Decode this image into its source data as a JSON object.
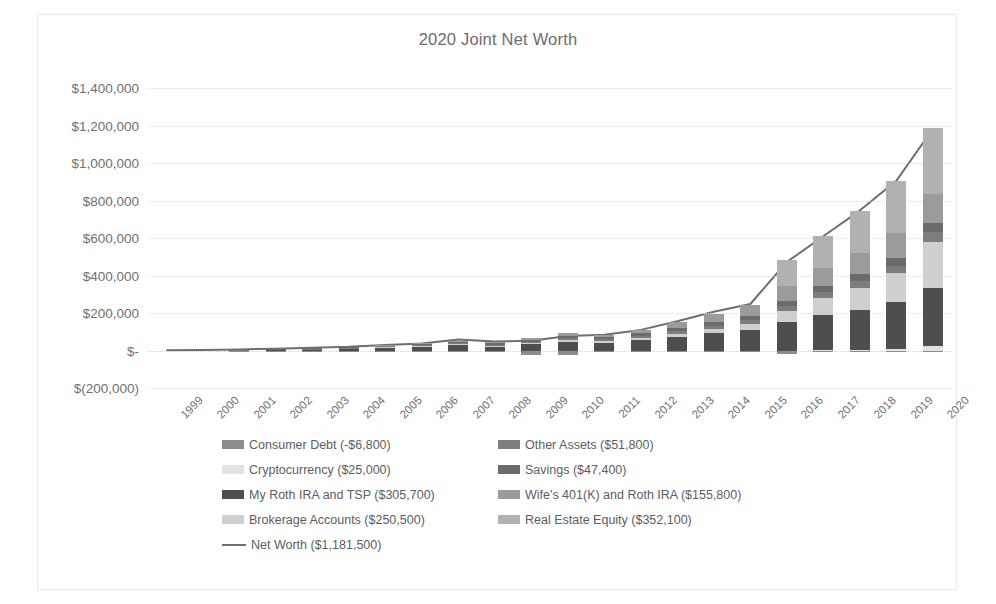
{
  "chart_data": {
    "type": "bar",
    "stacked": true,
    "title": "2020 Joint Net Worth",
    "xlabel": "",
    "ylabel": "",
    "ylim": [
      -200000,
      1400000
    ],
    "ytick_step": 200000,
    "ytick_labels": [
      "$1,400,000",
      "$1,200,000",
      "$1,000,000",
      "$800,000",
      "$600,000",
      "$400,000",
      "$200,000",
      "$-",
      "$(200,000)"
    ],
    "ytick_values": [
      1400000,
      1200000,
      1000000,
      800000,
      600000,
      400000,
      200000,
      0,
      -200000
    ],
    "grid": true,
    "legend_position": "bottom",
    "categories": [
      "1999",
      "2000",
      "2001",
      "2002",
      "2003",
      "2004",
      "2005",
      "2006",
      "2007",
      "2008",
      "2009",
      "2010",
      "2011",
      "2012",
      "2013",
      "2014",
      "2015",
      "2016",
      "2017",
      "2018",
      "2019",
      "2020"
    ],
    "series": [
      {
        "name": "Consumer Debt (-$6,800)",
        "label": "Consumer Debt",
        "current_value": -6800,
        "color": "#8b8c8e",
        "values": [
          0,
          0,
          -2000,
          -2500,
          -2500,
          -3000,
          -5000,
          -6000,
          -4000,
          -3000,
          -22000,
          -24000,
          -9000,
          -7000,
          -5000,
          -4000,
          -3000,
          -18000,
          -10000,
          -8000,
          -7000,
          -6800
        ]
      },
      {
        "name": "Cryptocurrency ($25,000)",
        "label": "Cryptocurrency",
        "current_value": 25000,
        "color": "#e2e2e2",
        "values": [
          0,
          0,
          0,
          0,
          0,
          0,
          0,
          0,
          0,
          0,
          0,
          0,
          0,
          0,
          0,
          0,
          0,
          0,
          4000,
          3000,
          6000,
          25000
        ]
      },
      {
        "name": "My Roth IRA and TSP ($305,700)",
        "label": "My Roth IRA and TSP",
        "current_value": 305700,
        "color": "#4d4e50",
        "values": [
          0,
          0,
          3000,
          5000,
          7000,
          10000,
          16000,
          22000,
          30000,
          22000,
          34000,
          48000,
          42000,
          56000,
          74000,
          92000,
          110000,
          150000,
          185000,
          215000,
          255000,
          305700
        ]
      },
      {
        "name": "Brokerage Accounts ($250,500)",
        "label": "Brokerage Accounts",
        "current_value": 250500,
        "color": "#cfcfcf",
        "values": [
          0,
          0,
          0,
          0,
          0,
          0,
          2000,
          3000,
          4000,
          3000,
          5000,
          8000,
          7000,
          10000,
          16000,
          24000,
          34000,
          60000,
          92000,
          118000,
          150000,
          250500
        ]
      },
      {
        "name": "Other Assets ($51,800)",
        "label": "Other Assets",
        "current_value": 51800,
        "color": "#7c7d7f",
        "values": [
          0,
          0,
          1000,
          1500,
          2000,
          2500,
          4000,
          5000,
          6000,
          6000,
          8000,
          10000,
          10000,
          12000,
          14000,
          17000,
          20000,
          26000,
          30000,
          36000,
          42000,
          51800
        ]
      },
      {
        "name": "Savings ($47,400)",
        "label": "Savings",
        "current_value": 47400,
        "color": "#6a6b6d",
        "values": [
          0,
          0,
          2000,
          2500,
          3000,
          4000,
          6000,
          7000,
          9000,
          8000,
          10000,
          14000,
          12000,
          14000,
          16000,
          19000,
          22000,
          28000,
          32000,
          36000,
          42000,
          47400
        ]
      },
      {
        "name": "Wife's 401(K) and Roth IRA ($155,800)",
        "label": "Wife's 401(K) and Roth IRA",
        "current_value": 155800,
        "color": "#9a9b9d",
        "values": [
          0,
          0,
          0,
          0,
          0,
          0,
          1000,
          2000,
          4000,
          4000,
          8000,
          12000,
          14000,
          20000,
          30000,
          42000,
          56000,
          78000,
          96000,
          112000,
          132000,
          155800
        ]
      },
      {
        "name": "Real Estate Equity ($352,100)",
        "label": "Real Estate Equity",
        "current_value": 352100,
        "color": "#b0b1b3",
        "values": [
          0,
          0,
          0,
          0,
          0,
          0,
          0,
          0,
          0,
          0,
          0,
          0,
          0,
          0,
          0,
          0,
          0,
          140000,
          170000,
          225000,
          275000,
          352100
        ]
      }
    ],
    "line_series": {
      "name": "Net Worth ($1,181,500)",
      "label": "Net Worth",
      "current_value": 1181500,
      "color": "#6d6e70",
      "values": [
        1000,
        2000,
        6000,
        9500,
        14500,
        20000,
        30000,
        38000,
        58000,
        48000,
        52000,
        78000,
        84000,
        110000,
        156000,
        207000,
        248000,
        472000,
        609000,
        746000,
        905000,
        1181500
      ]
    }
  },
  "legend": {
    "rows": [
      {
        "left": {
          "name": "Consumer Debt (-$6,800)",
          "type": "box"
        },
        "right": {
          "name": "Other Assets ($51,800)",
          "type": "box"
        }
      },
      {
        "left": {
          "name": "Cryptocurrency ($25,000)",
          "type": "box"
        },
        "right": {
          "name": "Savings ($47,400)",
          "type": "box"
        }
      },
      {
        "left": {
          "name": "My Roth IRA and TSP ($305,700)",
          "type": "box"
        },
        "right": {
          "name": "Wife's 401(K) and Roth IRA ($155,800)",
          "type": "box"
        }
      },
      {
        "left": {
          "name": "Brokerage Accounts ($250,500)",
          "type": "box"
        },
        "right": {
          "name": "Real Estate Equity ($352,100)",
          "type": "box"
        }
      },
      {
        "left": {
          "name": "Net Worth ($1,181,500)",
          "type": "line"
        },
        "right": null
      }
    ]
  }
}
